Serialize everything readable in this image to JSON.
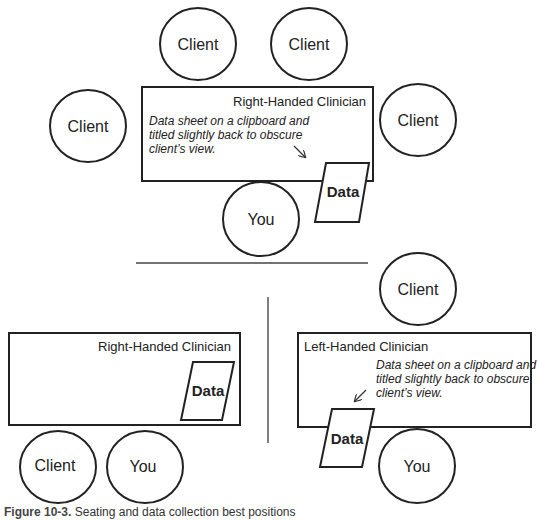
{
  "diagram": {
    "top_scene": {
      "clients": [
        {
          "label": "Client"
        },
        {
          "label": "Client"
        },
        {
          "label": "Client"
        },
        {
          "label": "Client"
        }
      ],
      "you": {
        "label": "You"
      },
      "table_title": "Right-Handed Clinician",
      "note_lines": [
        "Data sheet on a clipboard and",
        "titled slightly back to obscure",
        "client’s view."
      ],
      "data_label": "Data"
    },
    "bottom_left_scene": {
      "table_title": "Right-Handed Clinician",
      "data_label": "Data",
      "client": {
        "label": "Client"
      },
      "you": {
        "label": "You"
      }
    },
    "bottom_right_scene": {
      "table_title": "Left-Handed Clinician",
      "note_lines": [
        "Data sheet on a clipboard and",
        "titled slightly back to obscure",
        "client’s view."
      ],
      "data_label": "Data",
      "client": {
        "label": "Client"
      },
      "you": {
        "label": "You"
      }
    }
  },
  "caption": {
    "prefix": "Figure 10-3.",
    "text": "Seating and data collection best positions"
  }
}
